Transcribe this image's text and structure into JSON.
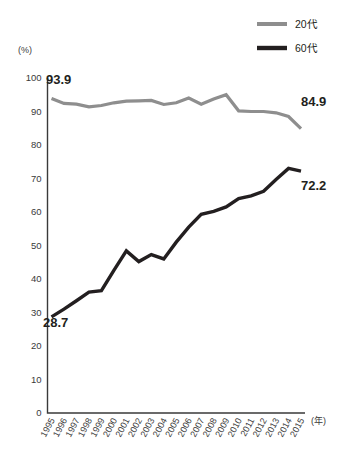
{
  "chart_data": {
    "type": "line",
    "title": "",
    "xlabel": "(年)",
    "ylabel": "(%)",
    "ylim": [
      0,
      100
    ],
    "ytick_step": 10,
    "yticks": [
      0,
      10,
      20,
      30,
      40,
      50,
      60,
      70,
      80,
      90,
      100
    ],
    "grid": false,
    "legend_position": "top-right",
    "categories": [
      "1995",
      "1996",
      "1997",
      "1998",
      "1999",
      "2000",
      "2001",
      "2002",
      "2003",
      "2004",
      "2005",
      "2006",
      "2007",
      "2008",
      "2009",
      "2010",
      "2011",
      "2012",
      "2013",
      "2014",
      "2015"
    ],
    "series": [
      {
        "name": "20代",
        "color": "#8e8e8e",
        "stroke_width": 3.2,
        "values": [
          93.9,
          92.4,
          92.2,
          91.4,
          91.8,
          92.6,
          93.1,
          93.2,
          93.3,
          92.1,
          92.6,
          94.0,
          92.2,
          93.7,
          95.0,
          90.2,
          90.0,
          90.0,
          89.6,
          88.5,
          84.9
        ]
      },
      {
        "name": "60代",
        "color": "#231f20",
        "stroke_width": 3.4,
        "values": [
          28.7,
          31.0,
          33.5,
          36.1,
          36.5,
          42.6,
          48.4,
          45.2,
          47.3,
          46.0,
          51.0,
          55.5,
          59.3,
          60.2,
          61.5,
          64.0,
          64.8,
          66.2,
          69.7,
          73.0,
          72.2
        ]
      }
    ],
    "annotations": [
      {
        "name": "label-20dai-start",
        "text": "93.9",
        "x_px": 46,
        "y_px": 84,
        "anchor": "start"
      },
      {
        "name": "label-20dai-end",
        "text": "84.9",
        "x_px": 301,
        "y_px": 106,
        "anchor": "start"
      },
      {
        "name": "label-60dai-start",
        "text": "28.7",
        "x_px": 43,
        "y_px": 327,
        "anchor": "start"
      },
      {
        "name": "label-60dai-end",
        "text": "72.2",
        "x_px": 301,
        "y_px": 190,
        "anchor": "start"
      }
    ]
  },
  "legend": {
    "items": [
      {
        "label": "20代",
        "color": "#8e8e8e"
      },
      {
        "label": "60代",
        "color": "#231f20"
      }
    ]
  },
  "axes": {
    "y_unit": "(%)",
    "x_unit": "(年)"
  }
}
